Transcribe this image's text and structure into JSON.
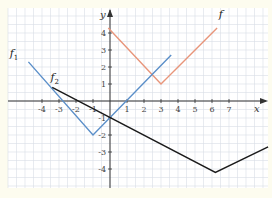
{
  "chart_data": {
    "type": "line",
    "title": "",
    "xlabel": "x",
    "ylabel": "y",
    "xlim": [
      -6,
      9.2
    ],
    "ylim": [
      -5.2,
      5.4
    ],
    "grid": true,
    "grid_step": 0.5,
    "x_ticks": [
      -4,
      -3,
      -2,
      -1,
      1,
      2,
      3,
      4,
      5,
      6,
      7
    ],
    "x_tick_labels": [
      "-4",
      "-3",
      "-2",
      "-1",
      "1",
      "2",
      "3",
      "4",
      "5",
      "6",
      "7"
    ],
    "y_ticks": [
      4,
      3,
      2,
      1,
      -1,
      -2,
      -3,
      -4
    ],
    "y_tick_labels": [
      "4",
      "3",
      "2",
      "1",
      "-1",
      "-2",
      "-3",
      "-4"
    ],
    "series": [
      {
        "name": "f",
        "label_main": "f",
        "label_sub": "",
        "color": "#e8957a",
        "points": [
          [
            -0.1,
            4.3
          ],
          [
            3,
            1
          ],
          [
            6.3,
            4.3
          ]
        ]
      },
      {
        "name": "f1",
        "label_main": "f",
        "label_sub": "1",
        "color": "#5b8fc9",
        "points": [
          [
            -4.8,
            2.3
          ],
          [
            -1,
            -2
          ],
          [
            3.6,
            2.7
          ]
        ]
      },
      {
        "name": "f2",
        "label_main": "f",
        "label_sub": "2",
        "color": "#1a1a1a",
        "points": [
          [
            -3.4,
            0.8
          ],
          [
            6.2,
            -4.2
          ],
          [
            9.3,
            -2.7
          ]
        ]
      }
    ],
    "series_label_positions": {
      "f": [
        6.4,
        4.9
      ],
      "f1": [
        -5.9,
        2.6
      ],
      "f2": [
        -3.5,
        1.2
      ]
    }
  }
}
